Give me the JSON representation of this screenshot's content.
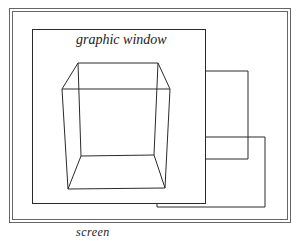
{
  "diagram": {
    "title_label": "graphic window",
    "screen_label": "screen",
    "colors": {
      "line": "#2a2a2a",
      "frame": "#555555",
      "background": "#ffffff"
    },
    "elements": [
      {
        "id": "screen-frame",
        "type": "double-rect",
        "x": 9,
        "y": 8,
        "w": 281,
        "h": 214
      },
      {
        "id": "graphic-window",
        "type": "rect",
        "x": 32,
        "y": 29,
        "w": 173,
        "h": 174
      },
      {
        "id": "background-window-1",
        "type": "partial-rect",
        "x": 205,
        "y": 71,
        "w": 43,
        "h": 88
      },
      {
        "id": "background-window-2",
        "type": "partial-rect",
        "x": 157,
        "y": 137,
        "w": 108,
        "h": 70
      },
      {
        "id": "wireframe-cube",
        "type": "cube"
      }
    ]
  }
}
